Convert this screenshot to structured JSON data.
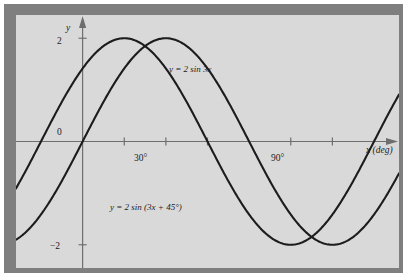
{
  "figure": {
    "background_color": "#ffffff",
    "frame_color": "#7f7f7f",
    "plot_background_color": "#d9d9d9",
    "curve_color": "#1c1c1c",
    "axis_color": "#6e6e6e"
  },
  "axes": {
    "y_axis_name": "y",
    "x_axis_name": "x (deg)",
    "y_ticks": [
      {
        "value": 2,
        "label": "2"
      },
      {
        "value": 0,
        "label": "0"
      },
      {
        "value": -2,
        "label": "−2"
      }
    ],
    "x_ticks": [
      {
        "value": 15,
        "label": ""
      },
      {
        "value": 30,
        "label": "30°"
      },
      {
        "value": 45,
        "label": ""
      },
      {
        "value": 75,
        "label": ""
      },
      {
        "value": 90,
        "label": "90°"
      }
    ],
    "xlim": [
      -24,
      114
    ],
    "ylim": [
      -2.45,
      2.45
    ],
    "grid": false
  },
  "annotations": [
    {
      "id": "curve-a-label",
      "text": "y = 2 sin 3x"
    },
    {
      "id": "curve-b-label",
      "text": "y = 2 sin (3x + 45°)"
    }
  ],
  "chart_data": {
    "type": "line",
    "title": "",
    "xlabel": "x (deg)",
    "ylabel": "y",
    "xlim": [
      -24,
      114
    ],
    "ylim": [
      -2.45,
      2.45
    ],
    "grid": false,
    "legend_position": "inline-annotation",
    "x_unit": "degrees",
    "series": [
      {
        "name": "y = 2 sin 3x",
        "amplitude": 2,
        "angular_frequency_deg": 3,
        "phase_shift_deg": 0,
        "period_deg": 120,
        "key_points": [
          {
            "x": 0,
            "y": 0
          },
          {
            "x": 30,
            "y": 2
          },
          {
            "x": 60,
            "y": 0
          },
          {
            "x": 90,
            "y": -2
          },
          {
            "x": 120,
            "y": 0
          }
        ]
      },
      {
        "name": "y = 2 sin (3x + 45°)",
        "amplitude": 2,
        "angular_frequency_deg": 3,
        "phase_shift_deg": 45,
        "period_deg": 120,
        "key_points": [
          {
            "x": -15,
            "y": 0
          },
          {
            "x": 15,
            "y": 2
          },
          {
            "x": 45,
            "y": 0
          },
          {
            "x": 75,
            "y": -2
          },
          {
            "x": 105,
            "y": 0
          }
        ]
      }
    ]
  }
}
